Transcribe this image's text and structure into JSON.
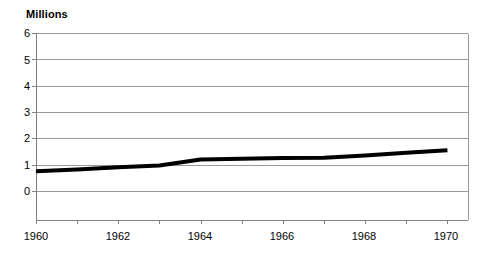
{
  "chart_data": {
    "type": "line",
    "title": "",
    "ylabel": "Millions",
    "xlabel": "",
    "axis_title_text": "Millions",
    "x": [
      1960,
      1961,
      1962,
      1963,
      1964,
      1965,
      1966,
      1967,
      1968,
      1969,
      1970
    ],
    "values": [
      0.75,
      0.82,
      0.9,
      0.97,
      1.2,
      1.22,
      1.25,
      1.26,
      1.35,
      1.45,
      1.55
    ],
    "series": [
      {
        "name": "",
        "values": [
          0.75,
          0.82,
          0.9,
          0.97,
          1.2,
          1.22,
          1.25,
          1.26,
          1.35,
          1.45,
          1.55
        ]
      }
    ],
    "x_tick_labels": [
      "1960",
      "1962",
      "1964",
      "1966",
      "1968",
      "1970"
    ],
    "x_tick_values": [
      1960,
      1962,
      1964,
      1966,
      1968,
      1970
    ],
    "x_minor_tick_values": [
      1960,
      1961,
      1962,
      1963,
      1964,
      1965,
      1966,
      1967,
      1968,
      1969,
      1970
    ],
    "y_tick_labels": [
      "0",
      "1",
      "2",
      "3",
      "4",
      "5",
      "6"
    ],
    "y_tick_values": [
      0,
      1,
      2,
      3,
      4,
      5,
      6
    ],
    "xlim": [
      1960,
      1970.5
    ],
    "ylim": [
      0,
      6
    ],
    "grid": true,
    "grid_axis": "y",
    "legend": "none",
    "colors": {
      "line": "#000000",
      "grid": "#999999",
      "axis": "#808080",
      "background": "#ffffff",
      "text": "#000000"
    },
    "line_width_px": 4
  }
}
